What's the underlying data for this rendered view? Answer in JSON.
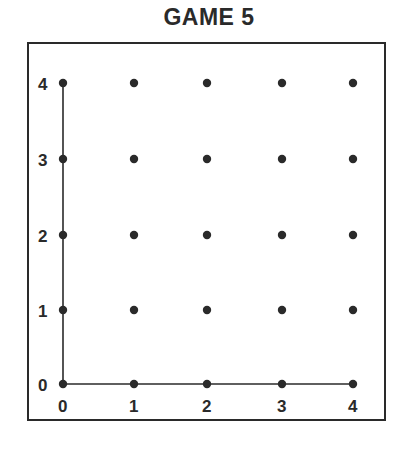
{
  "title": "GAME 5",
  "board": {
    "x_labels": [
      "0",
      "1",
      "2",
      "3",
      "4"
    ],
    "y_labels": [
      "0",
      "1",
      "2",
      "3",
      "4"
    ],
    "grid_size": 5,
    "dot_color": "#2a2a2a",
    "axes_drawn": [
      "x-axis from (0,0) to (4,0)",
      "y-axis from (0,0) to (0,4)"
    ]
  }
}
